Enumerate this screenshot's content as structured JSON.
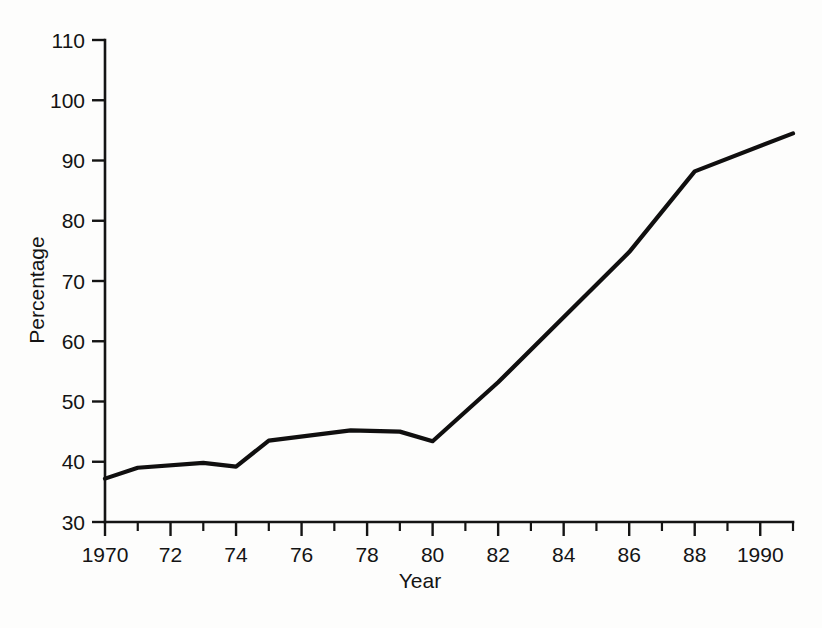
{
  "chart_data": {
    "type": "line",
    "title": "",
    "xlabel": "Year",
    "ylabel": "Percentage",
    "xlim": [
      1970,
      1991
    ],
    "ylim": [
      30,
      110
    ],
    "grid": false,
    "legend": null,
    "x_tick_labels": [
      "1970",
      "72",
      "74",
      "76",
      "78",
      "80",
      "82",
      "84",
      "86",
      "88",
      "1990"
    ],
    "x_tick_values": [
      1970,
      1972,
      1974,
      1976,
      1978,
      1980,
      1982,
      1984,
      1986,
      1988,
      1990
    ],
    "x_minor_tick_values": [
      1971,
      1973,
      1975,
      1977,
      1979,
      1981,
      1983,
      1985,
      1987,
      1989,
      1991
    ],
    "y_tick_labels": [
      "30",
      "40",
      "50",
      "60",
      "70",
      "80",
      "90",
      "100",
      "110"
    ],
    "y_tick_values": [
      30,
      40,
      50,
      60,
      70,
      80,
      90,
      100,
      110
    ],
    "series": [
      {
        "name": "Percentage",
        "color": "#100f0f",
        "x": [
          1970,
          1971,
          1973,
          1974,
          1975,
          1977.5,
          1979,
          1980,
          1982,
          1986,
          1988,
          1991
        ],
        "values": [
          37.2,
          39.0,
          39.8,
          39.2,
          43.5,
          45.2,
          45.0,
          43.4,
          53.2,
          74.8,
          88.2,
          94.5
        ]
      }
    ]
  },
  "axes": {
    "y_axis_title": "Percentage",
    "x_axis_title": "Year"
  },
  "colors": {
    "line": "#100f0f",
    "axis": "#141414",
    "background": "#fdfdfc"
  }
}
